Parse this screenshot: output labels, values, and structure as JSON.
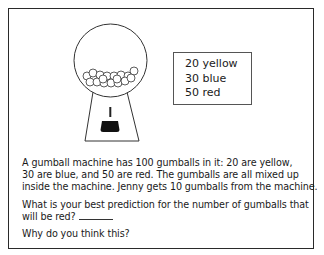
{
  "legend": {
    "items": [
      {
        "count": 20,
        "color": "yellow",
        "label": "20 yellow"
      },
      {
        "count": 30,
        "color": "blue",
        "label": "30 blue"
      },
      {
        "count": 50,
        "color": "red",
        "label": "50 red"
      }
    ]
  },
  "problem": {
    "lines": [
      "A gumball machine has 100 gumballs in it: 20 are yellow,",
      "30 are blue, and 50 are red. The gumballs are all mixed up",
      "inside the machine. Jenny gets 10 gumballs from the machine."
    ],
    "question_lines": [
      "What is your best prediction for the number of gumballs that",
      "will be red?"
    ],
    "answer_blank": "",
    "followup": "Why do you think this?"
  },
  "illustration": {
    "name": "gumball-machine",
    "gumball_count_drawn": 17
  }
}
